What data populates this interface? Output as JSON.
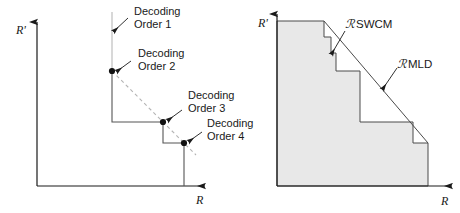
{
  "figure": {
    "background_color": "#ffffff",
    "line_color": "#1a1a1a",
    "shade_color": "#e8e8e8",
    "dashed_color": "#b0b0b0",
    "light_line_color": "#c8c8c8"
  },
  "left_panel": {
    "name": "decoding-order-staircase",
    "axis": {
      "y_label": "R'",
      "x_label": "R"
    },
    "annotations": [
      {
        "id": "order1",
        "label_line1": "Decoding",
        "label_line2": "Order 1"
      },
      {
        "id": "order2",
        "label_line1": "Decoding",
        "label_line2": "Order 2"
      },
      {
        "id": "order3",
        "label_line1": "Decoding",
        "label_line2": "Order 3"
      },
      {
        "id": "order4",
        "label_line1": "Decoding",
        "label_line2": "Order 4"
      }
    ],
    "corner_points": [
      {
        "id": "order1",
        "x": 112,
        "y": 21
      },
      {
        "id": "order2",
        "x": 112,
        "y": 71
      },
      {
        "id": "order3",
        "x": 163,
        "y": 122
      },
      {
        "id": "order4",
        "x": 184,
        "y": 143
      }
    ]
  },
  "right_panel": {
    "name": "rate-region-comparison",
    "axis": {
      "y_label": "R'",
      "x_label": "R"
    },
    "regions": [
      {
        "id": "swcm",
        "script": "ℛ",
        "label": "SWCM"
      },
      {
        "id": "mld",
        "script": "ℛ",
        "label": "MLD"
      }
    ],
    "shaded_region_fill": "#e8e8e8",
    "boundary_type": "staircase",
    "mld_boundary_type": "diagonal-line"
  }
}
